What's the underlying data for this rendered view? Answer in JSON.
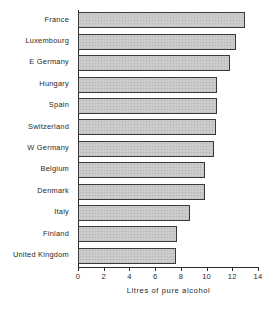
{
  "chart_data": {
    "type": "bar",
    "orientation": "horizontal",
    "title": "",
    "xlabel": "Litres of pure alcohol",
    "ylabel": "",
    "xlim": [
      0,
      14
    ],
    "xticks": [
      0,
      2,
      4,
      6,
      8,
      10,
      12,
      14
    ],
    "xtick_labels": [
      "0",
      "2",
      "4",
      "6",
      "8",
      "10",
      "12",
      "14"
    ],
    "grid": false,
    "legend": false,
    "categories": [
      "France",
      "Luxembourg",
      "E Germany",
      "Hungary",
      "Spain",
      "Switzerland",
      "W Germany",
      "Belgium",
      "Denmark",
      "Italy",
      "Finland",
      "United Kingdom"
    ],
    "values": [
      13.0,
      12.3,
      11.8,
      10.8,
      10.8,
      10.7,
      10.6,
      9.9,
      9.9,
      8.7,
      7.7,
      7.6
    ],
    "bar_fill_color": "#c9c9c9",
    "bar_edge_color": "#3a3a3a",
    "axis_color": "#2b2b2b"
  }
}
